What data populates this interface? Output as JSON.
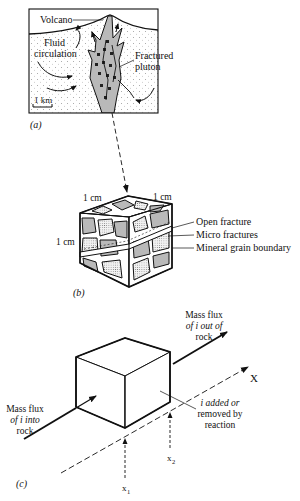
{
  "panel_a": {
    "label": "(a)",
    "volcano": "Volcano",
    "fluid_1": "Fluid",
    "fluid_2": "circulation",
    "fractured_1": "Fractured",
    "fractured_2": "pluton",
    "scale": "1 km"
  },
  "panel_b": {
    "label": "(b)",
    "dim_top_left": "1 cm",
    "dim_top_right": "1 cm",
    "dim_left": "1 cm",
    "callouts": [
      "Open fracture",
      "Micro fractures",
      "Mineral grain boundary"
    ]
  },
  "panel_c": {
    "label": "(c)",
    "flux_out": [
      "Mass flux",
      "of i out of",
      "rock"
    ],
    "flux_in": [
      "Mass flux",
      "of i into",
      "rock"
    ],
    "reaction": [
      "i added or",
      "removed by",
      "reaction"
    ],
    "axis": "X",
    "x1": "x",
    "x1_sub": "1",
    "x2": "x",
    "x2_sub": "2"
  }
}
